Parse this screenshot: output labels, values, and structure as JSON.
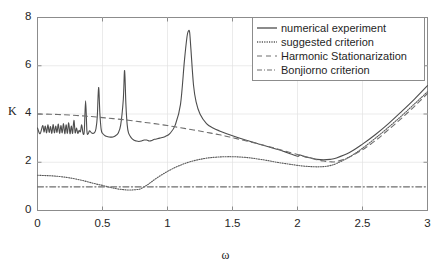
{
  "chart_data": {
    "type": "line",
    "title": "",
    "xlabel": "ω",
    "ylabel": "K",
    "xlim": [
      0,
      3
    ],
    "ylim": [
      0,
      8
    ],
    "xticks": [
      "0",
      "0.5",
      "1",
      "1.5",
      "2",
      "2.5",
      "3"
    ],
    "yticks": [
      "0",
      "2",
      "4",
      "6",
      "8"
    ],
    "grid": true,
    "legend_position": "top-right",
    "series": [
      {
        "name": "numerical experiment",
        "style": "solid",
        "color": "#4d4d4d",
        "x": [
          0.0,
          0.02,
          0.04,
          0.05,
          0.06,
          0.07,
          0.08,
          0.09,
          0.1,
          0.11,
          0.12,
          0.13,
          0.14,
          0.15,
          0.16,
          0.17,
          0.18,
          0.19,
          0.2,
          0.21,
          0.22,
          0.23,
          0.24,
          0.25,
          0.26,
          0.27,
          0.28,
          0.29,
          0.3,
          0.31,
          0.32,
          0.33,
          0.34,
          0.35,
          0.36,
          0.37,
          0.38,
          0.39,
          0.4,
          0.42,
          0.44,
          0.45,
          0.46,
          0.47,
          0.48,
          0.49,
          0.5,
          0.52,
          0.54,
          0.56,
          0.58,
          0.6,
          0.62,
          0.64,
          0.66,
          0.67,
          0.68,
          0.69,
          0.7,
          0.72,
          0.74,
          0.76,
          0.78,
          0.8,
          0.82,
          0.84,
          0.86,
          0.88,
          0.9,
          0.94,
          0.98,
          1.02,
          1.06,
          1.1,
          1.13,
          1.15,
          1.16,
          1.17,
          1.18,
          1.2,
          1.22,
          1.25,
          1.3,
          1.35,
          1.4,
          1.5,
          1.6,
          1.7,
          1.8,
          1.9,
          1.95,
          2.0,
          2.02,
          2.04,
          2.06,
          2.1,
          2.15,
          2.2,
          2.25,
          2.3,
          2.4,
          2.5,
          2.6,
          2.7,
          2.8,
          2.9,
          3.0
        ],
        "y": [
          3.42,
          3.18,
          3.52,
          3.25,
          3.5,
          3.22,
          3.55,
          3.24,
          3.48,
          3.2,
          3.56,
          3.22,
          3.5,
          3.24,
          3.58,
          3.2,
          3.52,
          3.22,
          3.6,
          3.18,
          3.55,
          3.2,
          3.64,
          3.18,
          3.5,
          3.2,
          3.74,
          3.22,
          3.42,
          3.2,
          3.32,
          3.26,
          3.55,
          3.2,
          3.3,
          4.55,
          3.3,
          3.18,
          3.3,
          3.2,
          3.24,
          3.4,
          3.9,
          5.1,
          4.0,
          3.35,
          3.2,
          3.1,
          3.06,
          3.04,
          3.05,
          3.1,
          3.2,
          3.55,
          4.6,
          5.8,
          4.4,
          3.55,
          3.22,
          3.02,
          2.92,
          2.88,
          2.86,
          2.88,
          2.92,
          2.92,
          2.88,
          2.9,
          2.95,
          3.0,
          3.06,
          3.2,
          3.55,
          4.4,
          6.2,
          7.2,
          7.43,
          7.4,
          6.7,
          5.2,
          4.5,
          4.0,
          3.6,
          3.42,
          3.3,
          3.1,
          2.92,
          2.76,
          2.6,
          2.44,
          2.34,
          2.25,
          2.3,
          2.26,
          2.22,
          2.18,
          2.12,
          2.1,
          2.12,
          2.18,
          2.4,
          2.75,
          3.15,
          3.6,
          4.1,
          4.62,
          5.18
        ]
      },
      {
        "name": "suggested criterion",
        "style": "dotted",
        "color": "#5a5a5a",
        "x": [
          0.0,
          0.05,
          0.1,
          0.15,
          0.2,
          0.25,
          0.3,
          0.35,
          0.4,
          0.45,
          0.5,
          0.55,
          0.6,
          0.65,
          0.7,
          0.72,
          0.75,
          0.78,
          0.8,
          0.85,
          0.9,
          0.95,
          1.0,
          1.05,
          1.1,
          1.15,
          1.2,
          1.25,
          1.3,
          1.35,
          1.4,
          1.45,
          1.5,
          1.55,
          1.6,
          1.65,
          1.7,
          1.75,
          1.8,
          1.85,
          1.9,
          1.95,
          2.0,
          2.05,
          2.1,
          2.15,
          2.2,
          2.25,
          2.3,
          2.4,
          2.5,
          2.6,
          2.7,
          2.8,
          2.9,
          3.0
        ],
        "y": [
          1.46,
          1.45,
          1.44,
          1.42,
          1.39,
          1.35,
          1.3,
          1.24,
          1.17,
          1.1,
          1.04,
          0.97,
          0.91,
          0.87,
          0.85,
          0.85,
          0.86,
          0.88,
          0.92,
          1.08,
          1.28,
          1.46,
          1.62,
          1.76,
          1.88,
          1.98,
          2.06,
          2.12,
          2.17,
          2.2,
          2.22,
          2.23,
          2.23,
          2.22,
          2.2,
          2.17,
          2.13,
          2.09,
          2.04,
          1.99,
          1.95,
          1.91,
          1.87,
          1.84,
          1.82,
          1.81,
          1.82,
          1.86,
          1.95,
          2.22,
          2.58,
          3.0,
          3.45,
          3.92,
          4.42,
          4.92
        ]
      },
      {
        "name": "Harmonic Stationarization",
        "style": "dashed",
        "color": "#6e6e6e",
        "x": [
          0.0,
          0.1,
          0.2,
          0.3,
          0.4,
          0.5,
          0.6,
          0.7,
          0.8,
          0.9,
          1.0,
          1.1,
          1.2,
          1.3,
          1.4,
          1.5,
          1.6,
          1.7,
          1.8,
          1.9,
          2.0,
          2.05,
          2.1,
          2.15,
          2.2,
          2.25,
          2.3,
          2.4,
          2.5,
          2.6,
          2.7,
          2.8,
          2.9,
          3.0
        ],
        "y": [
          4.0,
          3.99,
          3.97,
          3.94,
          3.9,
          3.85,
          3.8,
          3.74,
          3.67,
          3.6,
          3.52,
          3.43,
          3.34,
          3.24,
          3.14,
          3.02,
          2.89,
          2.76,
          2.62,
          2.47,
          2.32,
          2.25,
          2.18,
          2.1,
          2.05,
          2.02,
          2.03,
          2.22,
          2.52,
          2.9,
          3.35,
          3.82,
          4.32,
          4.85
        ]
      },
      {
        "name": "Bonjiorno criterion",
        "style": "dashdot",
        "color": "#6e6e6e",
        "x": [
          0.0,
          3.0
        ],
        "y": [
          0.98,
          0.98
        ]
      }
    ]
  },
  "legend": {
    "entries": [
      {
        "label": "numerical experiment"
      },
      {
        "label": "suggested criterion"
      },
      {
        "label": "Harmonic Stationarization"
      },
      {
        "label": "Bonjiorno criterion"
      }
    ]
  },
  "axes": {
    "ylabel": "K",
    "xlabel": "ω",
    "yticks": [
      "8",
      "6",
      "4",
      "2",
      "0"
    ],
    "xticks": [
      "0",
      "0.5",
      "1",
      "1.5",
      "2",
      "2.5",
      "3"
    ]
  }
}
